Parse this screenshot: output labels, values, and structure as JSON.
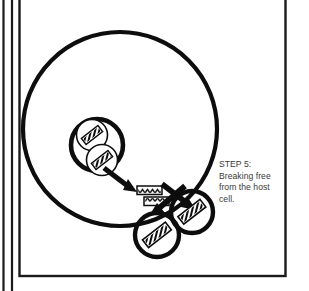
{
  "figure": {
    "kind": "biology-process-diagram",
    "topic": "viral-replication-cycle",
    "caption": "STEP 5: Breaking free from the host cell.",
    "caption_lines": [
      "STEP 5: Breaking",
      "free from the",
      "host cell."
    ],
    "step_label": "STEP 5",
    "colors": {
      "ink": "#0d0d0d",
      "background": "#ffffff",
      "caption_text": "#3b3b3b",
      "frame_border": "#1a1a1a",
      "margin_rule": "#1a1a1a"
    }
  },
  "frame": {
    "page_edge_rule_label": "page-edge-rule",
    "content_frame_label": "content-frame"
  },
  "shapes": {
    "host_cell": {
      "label": "host-cell-membrane",
      "cx": 120,
      "cy": 129,
      "r": 97,
      "stroke_width": 4.2
    },
    "nucleus": {
      "label": "host-cell-nucleus",
      "cx": 97,
      "cy": 145,
      "r": 26,
      "stroke_width": 4.6
    },
    "virions_in_nucleus": [
      {
        "label": "virion-upper",
        "cx": 92,
        "cy": 135,
        "r": 15.5,
        "angle": -38
      },
      {
        "label": "virion-lower",
        "cx": 102,
        "cy": 160,
        "r": 15.5,
        "angle": -38
      }
    ],
    "genome_strips": [
      {
        "label": "viral-genome-strip-upper",
        "x": 137,
        "y": 186,
        "w": 25,
        "h": 8.5
      },
      {
        "label": "viral-genome-strip-lower",
        "x": 144,
        "y": 197,
        "w": 25,
        "h": 8.5
      }
    ],
    "released_virions": [
      {
        "label": "released-virion-right",
        "cx": 192,
        "cy": 212,
        "r": 21,
        "angle": -38
      },
      {
        "label": "released-virion-lower-left",
        "cx": 157,
        "cy": 235,
        "r": 22,
        "angle": -38
      }
    ],
    "arrows": [
      {
        "label": "arrow-nucleus-to-genome",
        "from_x": 104,
        "from_y": 168,
        "to_x": 134,
        "to_y": 190
      },
      {
        "label": "arrow-budding-to-right-virion",
        "from_x": 160,
        "from_y": 184,
        "to_x": 193,
        "to_y": 208
      },
      {
        "label": "arrow-budding-to-lower-virion",
        "from_x": 183,
        "from_y": 186,
        "to_x": 150,
        "to_y": 216
      }
    ]
  }
}
